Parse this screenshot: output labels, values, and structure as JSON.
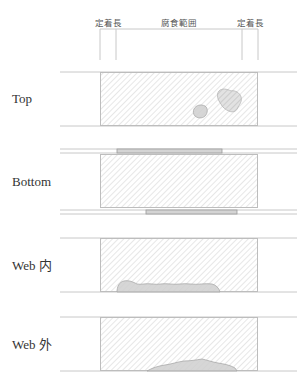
{
  "header": {
    "dimensions": [
      {
        "id": "anchor-left",
        "label": "定着長"
      },
      {
        "id": "corrosion-range",
        "label": "腐食範囲"
      },
      {
        "id": "anchor-right",
        "label": "定着長"
      }
    ]
  },
  "sections": [
    {
      "id": "top",
      "label": "Top",
      "corrosion": "two patches near right end of mid-plate"
    },
    {
      "id": "bottom",
      "label": "Bottom",
      "corrosion": "cover plates on upper and lower flanges"
    },
    {
      "id": "web-inner",
      "label": "Web 内",
      "corrosion": "elongated patch along lower edge"
    },
    {
      "id": "web-outer",
      "label": "Web 外",
      "corrosion": "low patch along lower edge"
    }
  ],
  "colors": {
    "line": "#c8c8c8",
    "hatch": "#cfcfcf",
    "corrosion_fill": "#cfcfcf",
    "corrosion_stroke": "#a8a8a8",
    "plate_fill": "#d4d4d4",
    "plate_stroke": "#9a9a9a",
    "text": "#333333"
  }
}
